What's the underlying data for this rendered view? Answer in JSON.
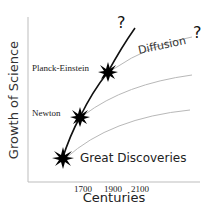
{
  "diagram": {
    "y_axis_label": "Growth of Science",
    "x_axis_label": "Centuries",
    "x_ticks": [
      "1700",
      "1900",
      "2100"
    ],
    "nodes": [
      {
        "label": "Newton"
      },
      {
        "label": "Planck-Einstein"
      },
      {
        "label": "Great Discoveries"
      }
    ],
    "diffusion_label": "Diffusion",
    "question_marks": [
      "?",
      "?"
    ],
    "colors": {
      "main_curve": "#111111",
      "diffusion_curves": "#b0b0b0",
      "axes": "#bdbdbd",
      "text": "#222222"
    }
  }
}
